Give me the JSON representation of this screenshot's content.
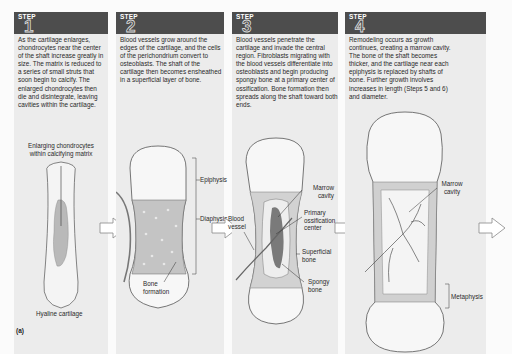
{
  "figure_label": "(a)",
  "step_word": "STEP",
  "panels": [
    {
      "number": "1",
      "description": "As the cartilage enlarges, chondrocytes near the center of the shaft increase greatly in size. The matrix is reduced to a series of small struts that soon begin to calcify. The enlarged chondrocytes then die and disintegrate, leaving cavities within the cartilage.",
      "labels": {
        "top": "Enlarging chondrocytes within calcifying matrix",
        "bottom": "Hyaline cartilage"
      }
    },
    {
      "number": "2",
      "description": "Blood vessels grow around the edges of the cartilage, and the cells of the perichondrium convert to osteoblasts. The shaft of the cartilage then becomes ensheathed in a superficial layer of bone.",
      "labels": {
        "epiphysis": "Epiphysis",
        "diaphysis": "Diaphysis",
        "bone_formation": "Bone formation"
      }
    },
    {
      "number": "3",
      "description": "Blood vessels penetrate the cartilage and invade the central region. Fibroblasts migrating with the blood vessels differentiate into osteoblasts and begin producing spongy bone at a primary center of ossification. Bone formation then spreads along the shaft toward both ends.",
      "labels": {
        "marrow_cavity": "Marrow cavity",
        "blood_vessel": "Blood vessel",
        "primary_center": "Primary ossification center",
        "superficial_bone": "Superficial bone",
        "spongy_bone": "Spongy bone"
      }
    },
    {
      "number": "4",
      "description": "Remodeling occurs as growth continues, creating a marrow cavity. The bone of the shaft becomes thicker, and the cartilage near each epiphysis is replaced by shafts of bone. Further growth involves increases in length (Steps 5 and 6) and diameter.",
      "labels": {
        "marrow_cavity": "Marrow cavity",
        "metaphysis": "Metaphysis"
      }
    }
  ],
  "colors": {
    "header": "#4d4d4d",
    "panel_bg": "#ececec",
    "bone": "#c9c9c9",
    "outline": "#555555"
  }
}
